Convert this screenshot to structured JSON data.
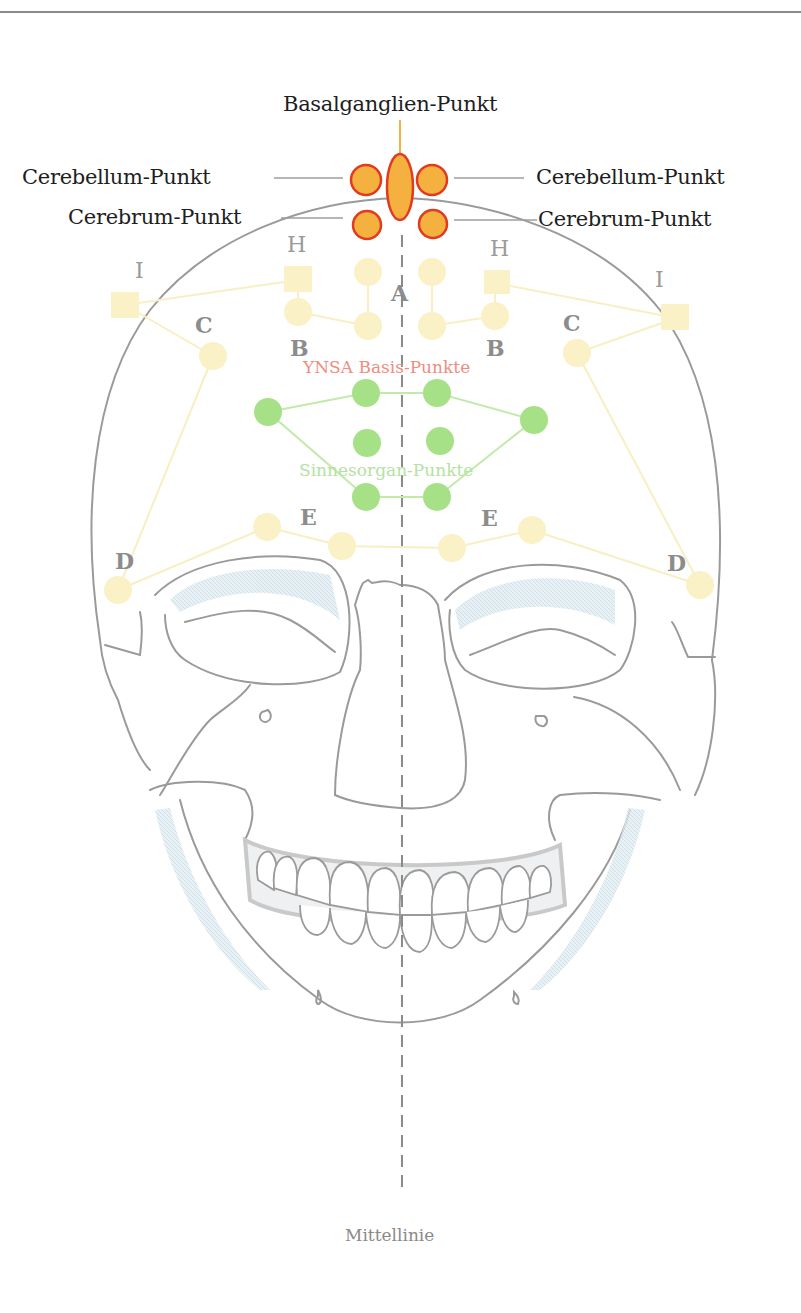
{
  "diagram": {
    "title_labels": {
      "basalganglien": "Basalganglien-Punkt",
      "cerebellum_left": "Cerebellum-Punkt",
      "cerebellum_right": "Cerebellum-Punkt",
      "cerebrum_left": "Cerebrum-Punkt",
      "cerebrum_right": "Cerebrum-Punkt"
    },
    "group_labels": {
      "ynsa_basis": "YNSA Basis-Punkte",
      "sinnesorgan": "Sinnesorgan-Punkte",
      "midline": "Mittellinie"
    },
    "point_letters": {
      "A": "A",
      "B_left": "B",
      "B_right": "B",
      "C_left": "C",
      "C_right": "C",
      "D_left": "D",
      "D_right": "D",
      "E_left": "E",
      "E_right": "E",
      "H_left": "H",
      "H_right": "H",
      "I_left": "I",
      "I_right": "I"
    },
    "colors": {
      "brain_points_fill": "#f5b13f",
      "brain_points_stroke": "#e23a1e",
      "basis_points_fill": "#fbf1c6",
      "sinnes_points_fill": "#a7e187",
      "sinnes_lines": "#c2eaa9",
      "skull_outline": "#9a9a9a",
      "midline": "#8a8a8a",
      "shading": "#d3e3ea"
    }
  }
}
